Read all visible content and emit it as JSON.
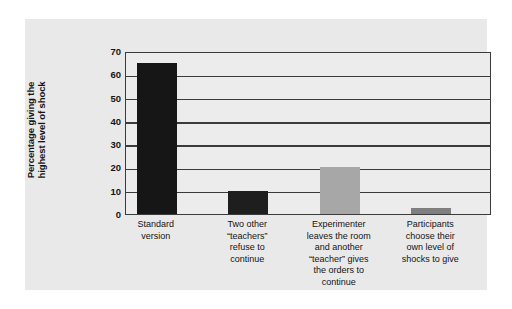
{
  "chart_data": {
    "type": "bar",
    "title": "",
    "xlabel": "",
    "ylabel": "Percentage giving the\nhighest level of shock",
    "ylim": [
      0,
      70
    ],
    "yticks": [
      0,
      10,
      20,
      30,
      40,
      50,
      60,
      70
    ],
    "ytick_labels": [
      "0",
      "10",
      "20",
      "30",
      "40",
      "50",
      "60",
      "70"
    ],
    "grid": true,
    "legend": "none",
    "categories": [
      "Standard\nversion",
      "Two other\n“teachers”\nrefuse to\ncontinue",
      "Experimenter\nleaves the room\nand another\n“teacher” gives\nthe orders to\ncontinue",
      "Participants\nchoose their\nown level of\nshocks to give"
    ],
    "values": [
      65,
      10,
      20,
      2.5
    ],
    "bar_colors": [
      "#161616",
      "#1e1e1e",
      "#a7a7a7",
      "#7f7f7f"
    ]
  },
  "colors": {
    "panel_background": "#e9e9e9",
    "plot_background": "#ececec",
    "axis_line": "#3b3b3b",
    "text": "#141414",
    "page_background": "#ffffff"
  }
}
